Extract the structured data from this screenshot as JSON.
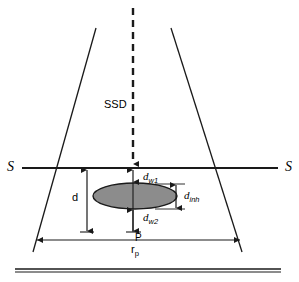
{
  "figure": {
    "background_color": "#ffffff",
    "line_color": "#1a1a1a",
    "ellipse_fill": "#8c8c8c",
    "ellipse_stroke": "#1a1a1a"
  },
  "labels": {
    "ssd": "SSD",
    "surface_left": "S",
    "surface_right": "S",
    "depth": "d",
    "d_w1_base": "d",
    "d_w1_sub": "w1",
    "d_w2_base": "d",
    "d_w2_sub": "w2",
    "d_inh_base": "d",
    "d_inh_sub": "inh",
    "point_p": "P",
    "radius_base": "r",
    "radius_sub": "p"
  },
  "elements": {
    "central_axis": "dashed-vertical-beam-axis",
    "left_beam_edge": "diverging-beam-edge-left",
    "right_beam_edge": "diverging-beam-edge-right",
    "surface_line": "patient-surface-line-S-S",
    "inhomogeneity": "shaded-ellipse-inhomogeneity",
    "bottom_line": "detector-baseline"
  },
  "geometry": {
    "width": 299,
    "height": 282,
    "axis_x": 133,
    "surface_y": 168,
    "point_p_y": 232,
    "ellipse_cx": 135,
    "ellipse_cy": 196,
    "ellipse_rx": 42,
    "ellipse_ry": 13
  }
}
